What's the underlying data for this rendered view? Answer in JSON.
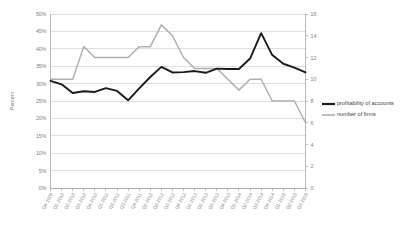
{
  "chart_data": {
    "type": "line",
    "title": "",
    "xlabel": "",
    "ylabel": "Percent",
    "y2label": "",
    "grid": true,
    "legend_position": "right",
    "ylim": [
      0,
      50
    ],
    "y2lim": [
      0,
      16
    ],
    "ytick_labels": [
      "50%",
      "45%",
      "40%",
      "35%",
      "30%",
      "25%",
      "20%",
      "15%",
      "10%",
      "5%",
      "0%"
    ],
    "ytick_values": [
      50,
      45,
      40,
      35,
      30,
      25,
      20,
      15,
      10,
      5,
      0
    ],
    "y2tick_labels": [
      "16",
      "14",
      "12",
      "10",
      "8",
      "6",
      "4",
      "2",
      "0"
    ],
    "y2tick_values": [
      16,
      14,
      12,
      10,
      8,
      6,
      4,
      2,
      0
    ],
    "categories": [
      "Q4-2009",
      "Q1-2010",
      "Q2-2010",
      "Q3-2010",
      "Q4-2010",
      "Q1-2011",
      "Q2-2011",
      "Q3-2011",
      "Q4-2011",
      "Q1-2012",
      "Q2-2012",
      "Q3-2012",
      "Q4-2012",
      "Q1-2013",
      "Q2-2013",
      "Q3-2013",
      "Q4-2013",
      "Q1-2014",
      "Q2-2014",
      "Q3-2014",
      "Q4-2014",
      "Q1-2015",
      "Q2-2015",
      "Q3-2015"
    ],
    "series": [
      {
        "name": "profitability of accounts",
        "axis": "left",
        "unit": "percent",
        "color": "#1a1a1a",
        "values": [
          30.8,
          29.8,
          27.3,
          27.8,
          27.6,
          28.7,
          27.9,
          25.2,
          28.6,
          31.9,
          34.8,
          33.2,
          33.3,
          33.6,
          33.1,
          34.3,
          34.2,
          34.2,
          37.2,
          44.5,
          38.2,
          35.7,
          34.6,
          33.2
        ]
      },
      {
        "name": "number of firms",
        "axis": "right",
        "unit": "count",
        "color": "#b0b0b0",
        "values": [
          10,
          10,
          10,
          13,
          12,
          12,
          12,
          12,
          13,
          13,
          15,
          14,
          12,
          11,
          11,
          11,
          10,
          9,
          10,
          10,
          8,
          8,
          8,
          6
        ]
      }
    ]
  },
  "legend": {
    "entries": [
      {
        "label": "profitability of accounts",
        "swatch": "thick-black-line"
      },
      {
        "label": "number of firms",
        "swatch": "thin-gray-line"
      }
    ]
  },
  "colors": {
    "series_primary": "#1a1a1a",
    "series_secondary": "#b0b0b0",
    "gridline": "#bfbfbf",
    "axis": "#9a9a9a",
    "text": "#808080",
    "background": "#ffffff"
  }
}
